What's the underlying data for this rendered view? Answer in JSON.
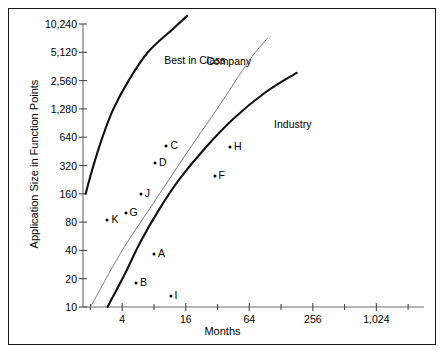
{
  "chart_data": {
    "type": "scatter",
    "title": "",
    "xlabel": "Months",
    "ylabel": "Application Size in Function Points",
    "xscale": "log2",
    "yscale": "log2",
    "xlim": [
      1.7,
      2896
    ],
    "ylim": [
      10,
      10240
    ],
    "grid": false,
    "legend_position": "inline-annotations",
    "x_tick_labels": [
      "4",
      "16",
      "64",
      "256",
      "1,024"
    ],
    "x_tick_values": [
      4,
      16,
      64,
      256,
      1024
    ],
    "x_minor_tick_values": [
      2,
      8,
      32,
      128,
      512,
      2048
    ],
    "y_tick_labels": [
      "10,240",
      "5,120",
      "2,560",
      "1,280",
      "640",
      "320",
      "160",
      "80",
      "40",
      "20",
      "10"
    ],
    "y_tick_values": [
      10240,
      5120,
      2560,
      1280,
      640,
      320,
      160,
      80,
      40,
      20,
      10
    ],
    "points": [
      {
        "label": "A",
        "x": 8.0,
        "y": 37
      },
      {
        "label": "B",
        "x": 5.4,
        "y": 18
      },
      {
        "label": "C",
        "x": 10.5,
        "y": 520
      },
      {
        "label": "D",
        "x": 8.2,
        "y": 340
      },
      {
        "label": "F",
        "x": 30.0,
        "y": 250
      },
      {
        "label": "G",
        "x": 4.3,
        "y": 100
      },
      {
        "label": "H",
        "x": 42.0,
        "y": 500
      },
      {
        "label": "I",
        "x": 11.5,
        "y": 13
      },
      {
        "label": "J",
        "x": 6.0,
        "y": 160
      },
      {
        "label": "K",
        "x": 2.9,
        "y": 85
      }
    ],
    "series": [
      {
        "name": "Best in Class",
        "style": "thick-curve",
        "label_position": {
          "x": 10,
          "y": 4200
        },
        "points": [
          [
            1.8,
            160
          ],
          [
            2.1,
            300
          ],
          [
            2.6,
            640
          ],
          [
            3.3,
            1280
          ],
          [
            4.6,
            2560
          ],
          [
            7.0,
            5120
          ],
          [
            12.0,
            9000
          ],
          [
            16.5,
            12500
          ]
        ]
      },
      {
        "name": "Company",
        "style": "thin-line",
        "label_position": {
          "x": 25,
          "y": 4100
        },
        "points": [
          [
            2.0,
            10
          ],
          [
            4.0,
            40
          ],
          [
            8.0,
            130
          ],
          [
            16.0,
            420
          ],
          [
            32.0,
            1300
          ],
          [
            64.0,
            4200
          ],
          [
            95.0,
            7200
          ]
        ]
      },
      {
        "name": "Industry",
        "style": "thick-curve",
        "label_position": {
          "x": 110,
          "y": 880
        },
        "points": [
          [
            2.9,
            10
          ],
          [
            4.2,
            22
          ],
          [
            6.0,
            50
          ],
          [
            9.0,
            110
          ],
          [
            14.0,
            230
          ],
          [
            24.0,
            480
          ],
          [
            45.0,
            1000
          ],
          [
            90.0,
            1900
          ],
          [
            180.0,
            3100
          ]
        ]
      }
    ]
  },
  "annotations": {
    "best_in_class": "Best in Class",
    "company": "Company",
    "industry": "Industry"
  }
}
